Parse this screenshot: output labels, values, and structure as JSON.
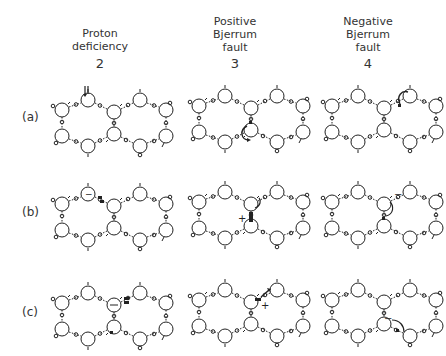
{
  "columns": [
    {
      "title_lines": [
        "Proton",
        "deficiency"
      ],
      "number": "2"
    },
    {
      "title_lines": [
        "Positive",
        "Bjerrum",
        "fault"
      ],
      "number": "3"
    },
    {
      "title_lines": [
        "Negative",
        "Bjerrum",
        "fault"
      ],
      "number": "4"
    }
  ],
  "rows": [
    {
      "label": "(a)"
    },
    {
      "label": "(b)"
    },
    {
      "label": "(c)"
    }
  ],
  "annotations": {
    "plus": "+",
    "minus": "−"
  },
  "colors": {
    "ink": "#222222",
    "background": "#ffffff"
  }
}
